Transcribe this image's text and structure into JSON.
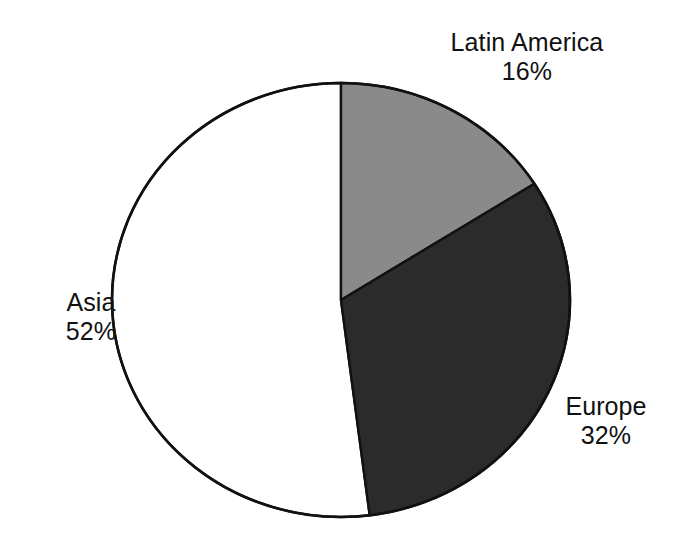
{
  "chart_data": {
    "type": "pie",
    "title": "",
    "subtitle": "",
    "xlabel": "",
    "ylabel": "",
    "legend_position": "none",
    "grid": false,
    "labels_on_slices": false,
    "label_placement": "outside",
    "start_angle_deg": 0,
    "direction": "clockwise",
    "categories": [
      "Latin America",
      "Europe",
      "Asia"
    ],
    "values": [
      16,
      32,
      52
    ],
    "units": "%",
    "slices": [
      {
        "name": "Latin America",
        "value": 16,
        "value_label": "16%",
        "color": "#8a8a8a",
        "start_angle_deg": 0,
        "end_angle_deg": 57.6
      },
      {
        "name": "Europe",
        "value": 32,
        "value_label": "32%",
        "color": "#2b2b2b",
        "start_angle_deg": 57.6,
        "end_angle_deg": 172.8
      },
      {
        "name": "Asia",
        "value": 52,
        "value_label": "52%",
        "color": "#ffffff",
        "start_angle_deg": 172.8,
        "end_angle_deg": 360
      }
    ],
    "outline_color": "#111111",
    "background": "#ffffff"
  },
  "labels": {
    "latin_america": {
      "name": "Latin America",
      "value": "16%"
    },
    "europe": {
      "name": "Europe",
      "value": "32%"
    },
    "asia": {
      "name": "Asia",
      "value": "52%"
    }
  },
  "geometry": {
    "center_x": 341,
    "center_y": 300,
    "radius_x": 229,
    "radius_y": 217
  }
}
